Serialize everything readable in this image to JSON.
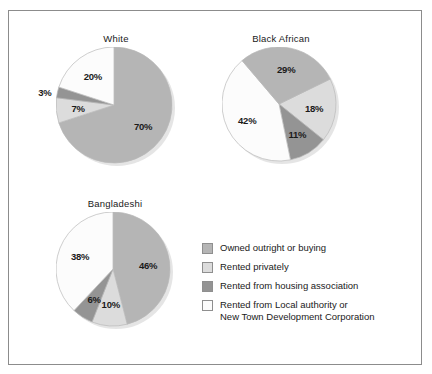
{
  "figure": {
    "background": "#ffffff",
    "frame_color": "#8c8c8c"
  },
  "palette": {
    "owned": "#b5b5b5",
    "private": "#dcdcdc",
    "housing_assoc": "#949494",
    "local_authority": "#fcfcfc",
    "swatch_border": "#8f8f8f",
    "text": "#1a1a1a"
  },
  "legend": {
    "items": [
      {
        "label": "Owned outright or buying",
        "color": "#b5b5b5"
      },
      {
        "label": "Rented privately",
        "color": "#dcdcdc"
      },
      {
        "label": "Rented from housing association",
        "color": "#949494"
      },
      {
        "label": "Rented from Local authority or\nNew Town Development Corporation",
        "color": "#fcfcfc"
      }
    ]
  },
  "chart_data": {
    "type": "pie",
    "title": "",
    "legend_position": "bottom-right",
    "categories": [
      "Owned outright or buying",
      "Rented privately",
      "Rented from housing association",
      "Rented from Local authority or New Town Development Corporation"
    ],
    "unit": "%",
    "charts": [
      {
        "title": "White",
        "labels": [
          "70%",
          "20%",
          "3%",
          "7%"
        ],
        "values": [
          70,
          7,
          3,
          20
        ],
        "slices": [
          {
            "category": "Owned outright or buying",
            "value": 70,
            "label": "70%",
            "color": "#b5b5b5"
          },
          {
            "category": "Rented privately",
            "value": 7,
            "label": "7%",
            "color": "#dcdcdc"
          },
          {
            "category": "Rented from housing association",
            "value": 3,
            "label": "3%",
            "color": "#949494"
          },
          {
            "category": "Rented from Local authority or New Town Development Corporation",
            "value": 20,
            "label": "20%",
            "color": "#fcfcfc"
          }
        ]
      },
      {
        "title": "Black African",
        "labels": [
          "29%",
          "18%",
          "11%",
          "42%"
        ],
        "values": [
          29,
          18,
          11,
          42
        ],
        "slices": [
          {
            "category": "Rented privately",
            "value": 18,
            "label": "18%",
            "color": "#dcdcdc"
          },
          {
            "category": "Rented from housing association",
            "value": 11,
            "label": "11%",
            "color": "#949494"
          },
          {
            "category": "Rented from Local authority or New Town Development Corporation",
            "value": 42,
            "label": "42%",
            "color": "#fcfcfc"
          },
          {
            "category": "Owned outright or buying",
            "value": 29,
            "label": "29%",
            "color": "#b5b5b5"
          }
        ]
      },
      {
        "title": "Bangladeshi",
        "labels": [
          "46%",
          "10%",
          "6%",
          "38%"
        ],
        "values": [
          46,
          10,
          6,
          38
        ],
        "slices": [
          {
            "category": "Owned outright or buying",
            "value": 46,
            "label": "46%",
            "color": "#b5b5b5"
          },
          {
            "category": "Rented privately",
            "value": 10,
            "label": "10%",
            "color": "#dcdcdc"
          },
          {
            "category": "Rented from housing association",
            "value": 6,
            "label": "6%",
            "color": "#949494"
          },
          {
            "category": "Rented from Local authority or New Town Development Corporation",
            "value": 38,
            "label": "38%",
            "color": "#fcfcfc"
          }
        ]
      }
    ]
  }
}
